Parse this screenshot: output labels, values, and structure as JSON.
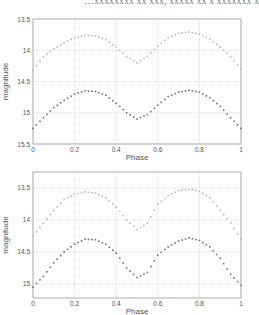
{
  "header_fragment": "…xxxxxxxx xx xxx,   xxxxx xx x xxxxxxx x",
  "chart_data": [
    {
      "type": "scatter",
      "title": "",
      "xlabel": "Phase",
      "ylabel": "magnitude",
      "xlim": [
        0,
        1
      ],
      "ylim": [
        15.5,
        13.5
      ],
      "y_inverted": true,
      "grid": true,
      "x_ticks": [
        "0",
        "0.2",
        "0.4",
        "0.6",
        "0.8",
        "1"
      ],
      "y_ticks": [
        "13.5",
        "14",
        "14.5",
        "15",
        "15.5"
      ],
      "series": [
        {
          "name": "upper",
          "color": "#b8b8b8",
          "x": [
            0,
            0.05,
            0.1,
            0.15,
            0.2,
            0.25,
            0.3,
            0.35,
            0.4,
            0.45,
            0.5,
            0.55,
            0.6,
            0.65,
            0.7,
            0.75,
            0.8,
            0.85,
            0.9,
            0.95,
            1.0
          ],
          "values": [
            14.32,
            14.1,
            13.98,
            13.88,
            13.8,
            13.76,
            13.77,
            13.83,
            13.95,
            14.1,
            14.2,
            14.1,
            13.93,
            13.8,
            13.73,
            13.71,
            13.74,
            13.82,
            13.95,
            14.1,
            14.3
          ]
        },
        {
          "name": "lower",
          "color": "#707070",
          "x": [
            0,
            0.05,
            0.1,
            0.15,
            0.2,
            0.25,
            0.3,
            0.35,
            0.4,
            0.45,
            0.5,
            0.55,
            0.6,
            0.65,
            0.7,
            0.75,
            0.8,
            0.85,
            0.9,
            0.95,
            1.0
          ],
          "values": [
            15.25,
            15.08,
            14.92,
            14.8,
            14.7,
            14.65,
            14.66,
            14.72,
            14.85,
            15.0,
            15.1,
            15.03,
            14.88,
            14.74,
            14.67,
            14.64,
            14.67,
            14.76,
            14.9,
            15.08,
            15.25
          ]
        }
      ]
    },
    {
      "type": "scatter",
      "title": "",
      "xlabel": "Phase",
      "ylabel": "magnitude",
      "xlim": [
        0,
        1
      ],
      "ylim": [
        15.22,
        13.25
      ],
      "y_inverted": true,
      "grid": true,
      "x_ticks": [
        "0",
        "0.2",
        "0.4",
        "0.6",
        "0.8",
        "1"
      ],
      "y_ticks": [
        "13.5",
        "14",
        "14.5",
        "15"
      ],
      "series": [
        {
          "name": "upper",
          "color": "#b8b8b8",
          "x": [
            0,
            0.05,
            0.1,
            0.15,
            0.2,
            0.25,
            0.3,
            0.35,
            0.4,
            0.45,
            0.5,
            0.55,
            0.6,
            0.65,
            0.7,
            0.75,
            0.8,
            0.85,
            0.9,
            0.95,
            1.0
          ],
          "values": [
            14.25,
            14.05,
            13.85,
            13.68,
            13.6,
            13.56,
            13.58,
            13.65,
            13.8,
            14.0,
            14.15,
            14.05,
            13.75,
            13.62,
            13.54,
            13.52,
            13.55,
            13.65,
            13.85,
            14.05,
            14.3
          ]
        },
        {
          "name": "lower",
          "color": "#707070",
          "x": [
            0,
            0.05,
            0.1,
            0.15,
            0.2,
            0.25,
            0.3,
            0.35,
            0.4,
            0.45,
            0.5,
            0.55,
            0.6,
            0.65,
            0.7,
            0.75,
            0.8,
            0.85,
            0.9,
            0.95,
            1.0
          ],
          "values": [
            15.05,
            14.88,
            14.67,
            14.5,
            14.38,
            14.3,
            14.31,
            14.38,
            14.52,
            14.75,
            14.9,
            14.82,
            14.55,
            14.42,
            14.33,
            14.28,
            14.32,
            14.42,
            14.6,
            14.85,
            15.02
          ]
        }
      ]
    }
  ]
}
